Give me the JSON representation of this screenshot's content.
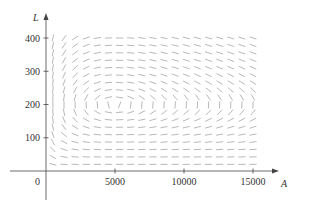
{
  "chart_data": {
    "type": "slope-field",
    "title": "",
    "xlabel": "A",
    "ylabel": "L",
    "origin_label": "0",
    "xlim": [
      0,
      16500
    ],
    "ylim": [
      0,
      440
    ],
    "x_ticks": [
      {
        "value": 5000,
        "label": "5000"
      },
      {
        "value": 10000,
        "label": "10000"
      },
      {
        "value": 15000,
        "label": "15000"
      }
    ],
    "y_ticks": [
      {
        "value": 100,
        "label": "100"
      },
      {
        "value": 200,
        "label": "200"
      },
      {
        "value": 300,
        "label": "300"
      },
      {
        "value": 400,
        "label": "400"
      }
    ],
    "grid": false,
    "field": {
      "description": "Direction field dL/dA for predator-prey system",
      "equation": "dL/dA = (-0.5 L + 0.0001 A L) / (2 A - 0.01 A L)",
      "equilibrium": {
        "A": 5000,
        "L": 200
      },
      "A_samples": {
        "start": 500,
        "end": 15000,
        "count": 19
      },
      "L_samples": {
        "start": 20,
        "end": 400,
        "count": 18
      }
    },
    "colors": {
      "axis": "#444444",
      "segment": "#9a9a9a",
      "text": "#333333"
    }
  }
}
